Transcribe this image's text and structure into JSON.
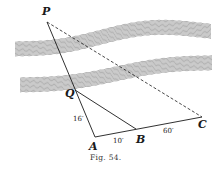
{
  "figure": {
    "caption": "Fig. 54.",
    "points": {
      "P": "P",
      "Q": "Q",
      "A": "A",
      "B": "B",
      "C": "C"
    },
    "measurements": {
      "AQ": "16′",
      "AB": "10′",
      "BC": "60′"
    },
    "colors": {
      "ink": "#1a1a1a",
      "river": "#555555",
      "background": "#ffffff"
    }
  }
}
